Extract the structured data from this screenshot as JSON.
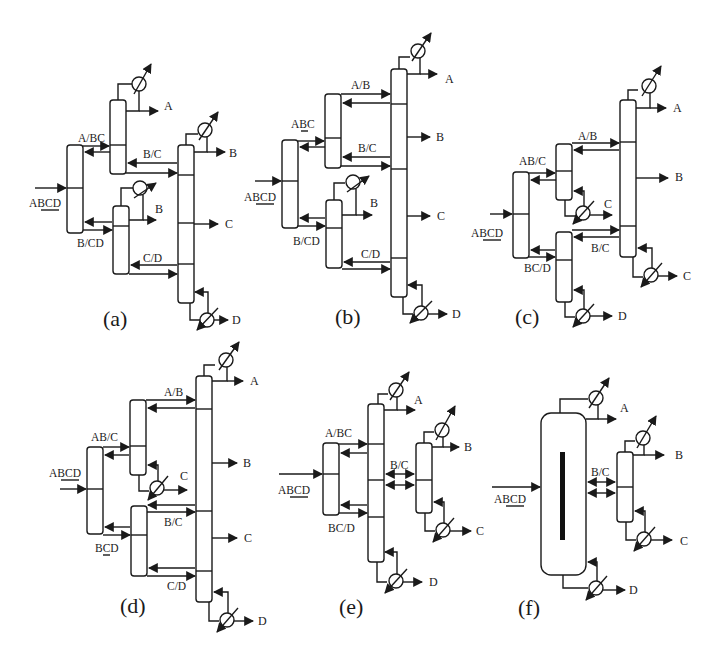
{
  "figure": {
    "panels": [
      {
        "id": "a",
        "caption": "(a)",
        "feed": "ABCD",
        "feed_underlined": "BC",
        "splits": [
          "A/BC",
          "B/CD",
          "B/C",
          "C/D"
        ],
        "products": [
          "A",
          "B",
          "B",
          "C",
          "D"
        ]
      },
      {
        "id": "b",
        "caption": "(b)",
        "feed": "ABCD",
        "feed_underlined": "BC",
        "splits": [
          "ABC",
          "B/CD",
          "A/B",
          "B/C",
          "C/D"
        ],
        "products": [
          "A",
          "B",
          "B",
          "C",
          "D"
        ]
      },
      {
        "id": "c",
        "caption": "(c)",
        "feed": "ABCD",
        "feed_underlined": "BC",
        "splits": [
          "AB/C",
          "BC/D",
          "A/B",
          "B/C"
        ],
        "products": [
          "A",
          "B",
          "C",
          "C",
          "D"
        ]
      },
      {
        "id": "d",
        "caption": "(d)",
        "feed": "ABCD",
        "feed_underlined": "BC",
        "splits": [
          "AB/C",
          "BCD",
          "A/B",
          "B/C",
          "C/D"
        ],
        "products": [
          "A",
          "B",
          "C",
          "C",
          "D"
        ]
      },
      {
        "id": "e",
        "caption": "(e)",
        "feed": "ABCD",
        "feed_underlined": "BC",
        "splits": [
          "A/BC",
          "BC/D",
          "B/C"
        ],
        "products": [
          "A",
          "B",
          "C",
          "D"
        ]
      },
      {
        "id": "f",
        "caption": "(f)",
        "feed": "ABCD",
        "feed_underlined": "BC",
        "splits": [
          "B/C"
        ],
        "products": [
          "A",
          "B",
          "C",
          "D"
        ]
      }
    ]
  }
}
